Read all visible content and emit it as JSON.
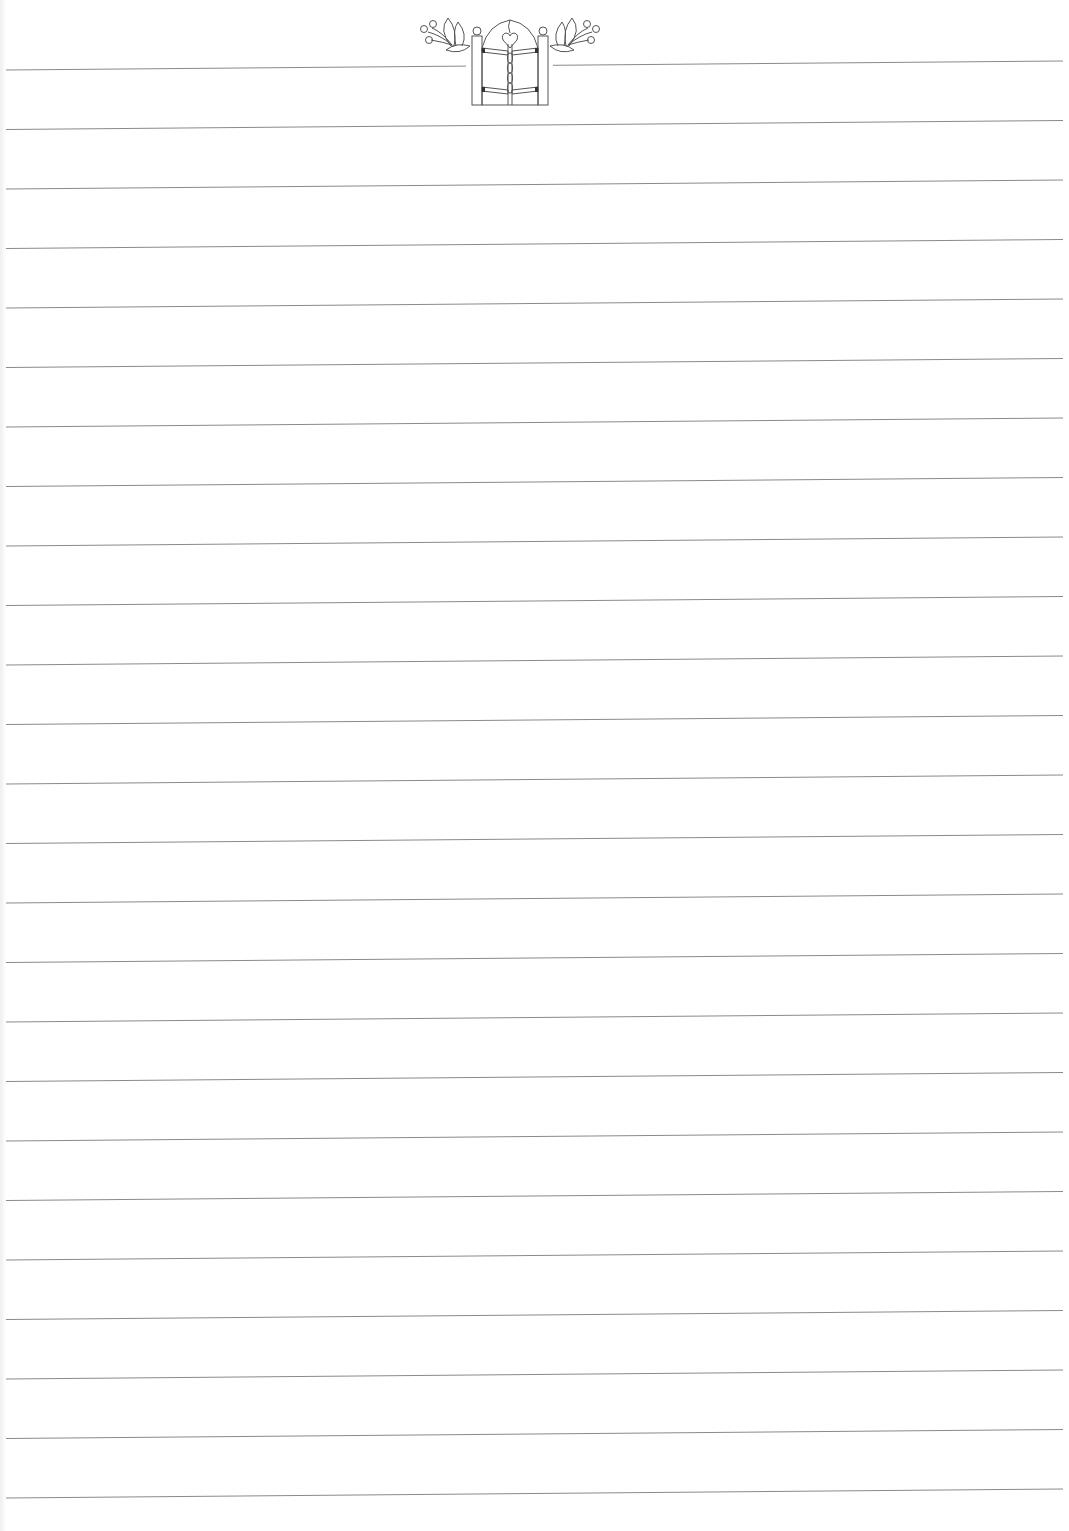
{
  "page": {
    "type": "lined-stationery",
    "background_color": "#ffffff",
    "line_color": "#8a8a8a",
    "ornament_color": "#555555",
    "line_count": 25,
    "line_left_x": 6,
    "line_right_x": 1063,
    "line_spacing_px": 59.5,
    "first_line_y": 70,
    "line_slope_px": -9
  },
  "ornament": {
    "subject": "garden-gate-with-flowers",
    "elements": [
      "left-flower",
      "left-gate-post",
      "arched-double-gate",
      "heart",
      "twisted-center-bar",
      "hinges",
      "right-gate-post",
      "right-flower"
    ]
  }
}
